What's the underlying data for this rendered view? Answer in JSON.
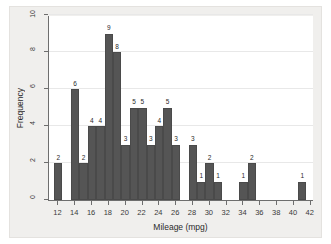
{
  "chart_data": {
    "type": "bar",
    "title": "",
    "xlabel": "Mileage (mpg)",
    "ylabel": "Frequency",
    "xlim": [
      11,
      42.5
    ],
    "ylim": [
      0,
      10
    ],
    "xticks": [
      12,
      14,
      16,
      18,
      20,
      22,
      24,
      26,
      28,
      30,
      32,
      34,
      36,
      38,
      40,
      42
    ],
    "yticks": [
      0,
      2,
      4,
      6,
      8,
      10
    ],
    "grid": "horizontal",
    "legend": "none",
    "bin_width": 1,
    "bars": [
      {
        "bin_start": 11.6,
        "bin_end": 12.6,
        "center": 12.1,
        "value": 2
      },
      {
        "bin_start": 13.6,
        "bin_end": 14.6,
        "center": 14.1,
        "value": 6
      },
      {
        "bin_start": 14.6,
        "bin_end": 15.6,
        "center": 15.1,
        "value": 2
      },
      {
        "bin_start": 15.6,
        "bin_end": 16.6,
        "center": 16.1,
        "value": 4
      },
      {
        "bin_start": 16.6,
        "bin_end": 17.6,
        "center": 17.1,
        "value": 4
      },
      {
        "bin_start": 17.6,
        "bin_end": 18.6,
        "center": 18.1,
        "value": 9
      },
      {
        "bin_start": 18.6,
        "bin_end": 19.6,
        "center": 19.1,
        "value": 8
      },
      {
        "bin_start": 19.6,
        "bin_end": 20.6,
        "center": 20.1,
        "value": 3
      },
      {
        "bin_start": 20.6,
        "bin_end": 21.6,
        "center": 21.1,
        "value": 5
      },
      {
        "bin_start": 21.6,
        "bin_end": 22.6,
        "center": 22.1,
        "value": 5
      },
      {
        "bin_start": 22.6,
        "bin_end": 23.6,
        "center": 23.1,
        "value": 3
      },
      {
        "bin_start": 23.6,
        "bin_end": 24.6,
        "center": 24.1,
        "value": 4
      },
      {
        "bin_start": 24.6,
        "bin_end": 25.6,
        "center": 25.1,
        "value": 5
      },
      {
        "bin_start": 25.6,
        "bin_end": 26.6,
        "center": 26.1,
        "value": 3
      },
      {
        "bin_start": 27.6,
        "bin_end": 28.6,
        "center": 28.1,
        "value": 3
      },
      {
        "bin_start": 28.6,
        "bin_end": 29.6,
        "center": 29.1,
        "value": 1
      },
      {
        "bin_start": 29.6,
        "bin_end": 30.6,
        "center": 30.1,
        "value": 2
      },
      {
        "bin_start": 30.6,
        "bin_end": 31.6,
        "center": 31.1,
        "value": 1
      },
      {
        "bin_start": 33.6,
        "bin_end": 34.6,
        "center": 34.1,
        "value": 1
      },
      {
        "bin_start": 34.6,
        "bin_end": 35.6,
        "center": 35.1,
        "value": 2
      },
      {
        "bin_start": 40.6,
        "bin_end": 41.6,
        "center": 41.1,
        "value": 1
      }
    ],
    "colors": {
      "bar_fill": "#555555",
      "bar_edge": "#4a4a4a",
      "plot_background": "#ffffff",
      "figure_background": "#f0efed",
      "axis": "#6e6e6e",
      "gridline": "#e8e8e8",
      "text": "#2a2a2a"
    }
  }
}
